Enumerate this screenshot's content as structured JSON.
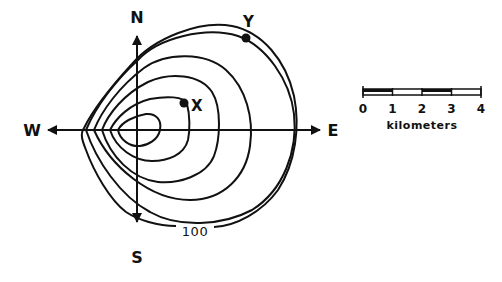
{
  "figure": {
    "type": "contour-map",
    "compass": {
      "north": "N",
      "south": "S",
      "east": "E",
      "west": "W"
    },
    "points": [
      {
        "id": "X",
        "label": "X"
      },
      {
        "id": "Y",
        "label": "Y"
      }
    ],
    "contour_label": "100",
    "contour_count": 6,
    "scale_bar": {
      "ticks": [
        "0",
        "1",
        "2",
        "3",
        "4"
      ],
      "unit": "kilometers"
    },
    "colors": {
      "ink": "#111111",
      "background": "#ffffff"
    }
  }
}
